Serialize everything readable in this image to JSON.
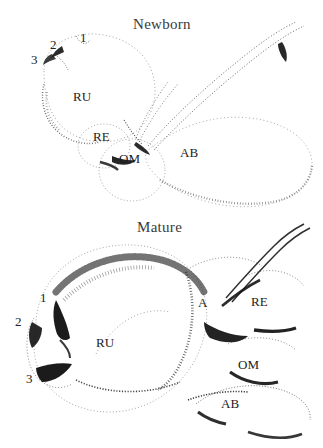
{
  "figure": {
    "background_color": "#ffffff",
    "ink_color": "#1c1c1c",
    "style": "stipple-drawing"
  },
  "panels": [
    {
      "id": "newborn",
      "title": "Newborn",
      "title_pos": {
        "x": 133,
        "y": 16
      },
      "annotations": [
        {
          "name": "label-rumen",
          "text": "RU",
          "x": 73,
          "y": 90,
          "kind": "compartment"
        },
        {
          "name": "label-reticulum",
          "text": "RE",
          "x": 93,
          "y": 130,
          "kind": "compartment"
        },
        {
          "name": "label-omasum",
          "text": "OM",
          "x": 119,
          "y": 152,
          "kind": "compartment"
        },
        {
          "name": "label-abomasum",
          "text": "AB",
          "x": 180,
          "y": 146,
          "kind": "compartment"
        },
        {
          "name": "marker-1",
          "text": "1",
          "x": 80,
          "y": 31,
          "kind": "numeric"
        },
        {
          "name": "marker-2",
          "text": "2",
          "x": 50,
          "y": 38,
          "kind": "numeric"
        },
        {
          "name": "marker-3",
          "text": "3",
          "x": 31,
          "y": 53,
          "kind": "numeric"
        }
      ]
    },
    {
      "id": "mature",
      "title": "Mature",
      "title_pos": {
        "x": 137,
        "y": 219
      },
      "annotations": [
        {
          "name": "label-rumen",
          "text": "RU",
          "x": 96,
          "y": 336,
          "kind": "compartment"
        },
        {
          "name": "label-atrium",
          "text": "A",
          "x": 198,
          "y": 296,
          "kind": "compartment"
        },
        {
          "name": "label-reticulum",
          "text": "RE",
          "x": 251,
          "y": 295,
          "kind": "compartment"
        },
        {
          "name": "label-omasum",
          "text": "OM",
          "x": 238,
          "y": 358,
          "kind": "compartment"
        },
        {
          "name": "label-abomasum",
          "text": "AB",
          "x": 221,
          "y": 397,
          "kind": "compartment"
        },
        {
          "name": "marker-1",
          "text": "1",
          "x": 40,
          "y": 291,
          "kind": "numeric"
        },
        {
          "name": "marker-2",
          "text": "2",
          "x": 15,
          "y": 315,
          "kind": "numeric"
        },
        {
          "name": "marker-3",
          "text": "3",
          "x": 26,
          "y": 372,
          "kind": "numeric"
        }
      ]
    }
  ]
}
